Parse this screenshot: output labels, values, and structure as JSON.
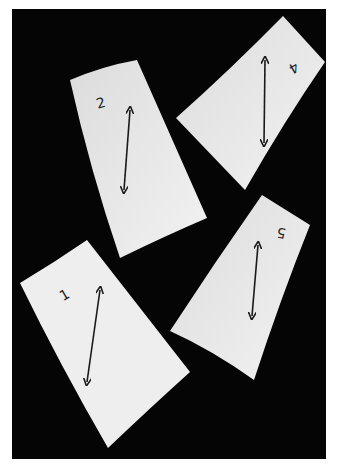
{
  "image": {
    "description": "Photograph of four rectangular paper pieces with hand-drawn double-headed arrows and numbers on a black background",
    "background_color": "#050505",
    "border_color": "#ffffff",
    "paper_color": "#e8e8e8"
  },
  "pieces": [
    {
      "label": "2",
      "position": "top-left"
    },
    {
      "label": "4",
      "position": "top-right"
    },
    {
      "label": "1",
      "position": "bottom-left"
    },
    {
      "label": "5",
      "position": "bottom-right"
    }
  ]
}
